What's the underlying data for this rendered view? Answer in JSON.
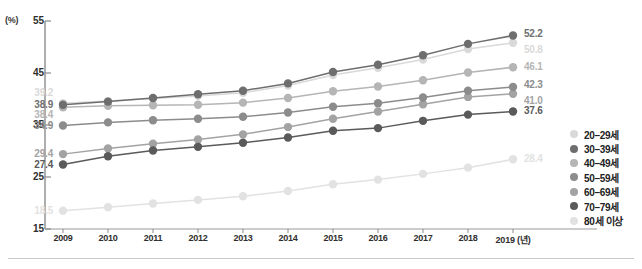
{
  "axis": {
    "unit_label": "(%)",
    "y_ticks": [
      "55",
      "45",
      "35",
      "25",
      "15"
    ],
    "x_ticks": [
      "2009",
      "2010",
      "2011",
      "2012",
      "2013",
      "2014",
      "2015",
      "2016",
      "2017",
      "2018",
      "2019 (년)"
    ]
  },
  "legend": {
    "items": [
      {
        "label": "20–29세",
        "color": "#d9d9d9"
      },
      {
        "label": "30–39세",
        "color": "#6e6e6e"
      },
      {
        "label": "40–49세",
        "color": "#b5b5b5"
      },
      {
        "label": "50–59세",
        "color": "#8c8c8c"
      },
      {
        "label": "60–69세",
        "color": "#a3a3a3"
      },
      {
        "label": "70–79세",
        "color": "#5a5a5a"
      },
      {
        "label": "80세 이상",
        "color": "#e2e2e2"
      }
    ]
  },
  "chart_data": {
    "type": "line",
    "title": "",
    "xlabel": "년",
    "ylabel": "(%)",
    "ylim": [
      15,
      55
    ],
    "grid": false,
    "legend_position": "right",
    "categories": [
      2009,
      2010,
      2011,
      2012,
      2013,
      2014,
      2015,
      2016,
      2017,
      2018,
      2019
    ],
    "series": [
      {
        "name": "20–29세",
        "color": "#d9d9d9",
        "start_label": "39.2",
        "end_label": "50.8",
        "values": [
          39.2,
          39.6,
          40.1,
          40.6,
          41.2,
          42.6,
          44.6,
          46.0,
          47.6,
          49.6,
          50.8
        ]
      },
      {
        "name": "30–39세",
        "color": "#6e6e6e",
        "start_label": "38.9",
        "end_label": "52.2",
        "values": [
          38.9,
          39.5,
          40.2,
          40.9,
          41.6,
          43.0,
          45.2,
          46.6,
          48.4,
          50.6,
          52.2
        ]
      },
      {
        "name": "40–49세",
        "color": "#b5b5b5",
        "start_label": "38.4",
        "end_label": "46.1",
        "values": [
          38.4,
          38.7,
          38.8,
          38.9,
          39.3,
          40.2,
          41.5,
          42.4,
          43.6,
          45.1,
          46.1
        ]
      },
      {
        "name": "50–59세",
        "color": "#8c8c8c",
        "start_label": "34.9",
        "end_label": "42.3",
        "values": [
          34.9,
          35.5,
          35.9,
          36.2,
          36.6,
          37.4,
          38.5,
          39.2,
          40.3,
          41.6,
          42.3
        ]
      },
      {
        "name": "60–69세",
        "color": "#a3a3a3",
        "start_label": "29.4",
        "end_label": "41.0",
        "values": [
          29.4,
          30.5,
          31.4,
          32.2,
          33.2,
          34.6,
          36.2,
          37.6,
          39.0,
          40.4,
          41.0
        ]
      },
      {
        "name": "70–79세",
        "color": "#5a5a5a",
        "start_label": "27.4",
        "end_label": "37.6",
        "values": [
          27.4,
          29.0,
          30.1,
          30.8,
          31.6,
          32.6,
          33.9,
          34.4,
          35.8,
          37.0,
          37.6
        ]
      },
      {
        "name": "80세 이상",
        "color": "#e2e2e2",
        "start_label": "18.5",
        "end_label": "28.4",
        "values": [
          18.5,
          19.2,
          19.9,
          20.6,
          21.3,
          22.3,
          23.6,
          24.5,
          25.6,
          26.8,
          28.4
        ]
      }
    ]
  }
}
